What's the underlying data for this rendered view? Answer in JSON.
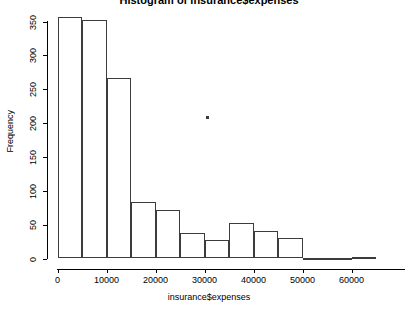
{
  "chart_data": {
    "type": "bar",
    "title": "Histogram of insurance$expenses",
    "xlabel": "insurance$expenses",
    "ylabel": "Frequency",
    "xlim": [
      0,
      65000
    ],
    "ylim": [
      0,
      360
    ],
    "grid": false,
    "legend": null,
    "bin_width": 5000,
    "bin_edges": [
      0,
      5000,
      10000,
      15000,
      20000,
      25000,
      30000,
      35000,
      40000,
      45000,
      50000,
      55000,
      60000,
      65000
    ],
    "categories": [
      "0-5000",
      "5000-10000",
      "10000-15000",
      "15000-20000",
      "20000-25000",
      "25000-30000",
      "30000-35000",
      "35000-40000",
      "40000-45000",
      "45000-50000",
      "50000-55000",
      "55000-60000",
      "60000-65000"
    ],
    "values": [
      357,
      352,
      266,
      83,
      71,
      38,
      28,
      53,
      40,
      30,
      1,
      1,
      2
    ],
    "x_ticks": [
      0,
      10000,
      20000,
      30000,
      40000,
      50000,
      60000
    ],
    "x_tick_labels": [
      "0",
      "10000",
      "20000",
      "30000",
      "40000",
      "50000",
      "60000"
    ],
    "y_ticks": [
      0,
      50,
      100,
      150,
      200,
      250,
      300,
      350
    ],
    "y_tick_labels": [
      "0",
      "50",
      "100",
      "150",
      "200",
      "250",
      "300",
      "350"
    ],
    "bar_color": "transparent",
    "bar_border_color": "#3c3c3c",
    "axis_color": "#000000",
    "background": "#ffffff"
  }
}
